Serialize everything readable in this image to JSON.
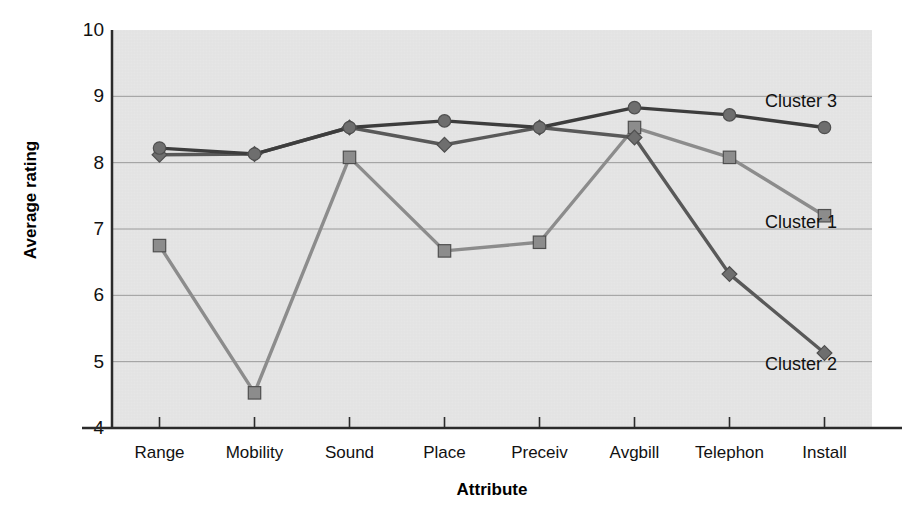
{
  "chart_data": {
    "type": "line",
    "title": "",
    "xlabel": "Attribute",
    "ylabel": "Average rating",
    "categories": [
      "Range",
      "Mobility",
      "Sound",
      "Place",
      "Preceiv",
      "Avgbill",
      "Telephon",
      "Install"
    ],
    "ylim": [
      4,
      10
    ],
    "yticks": [
      4,
      5,
      6,
      7,
      8,
      9,
      10
    ],
    "ytick_labels": [
      "4",
      "5",
      "6",
      "7",
      "8",
      "9",
      "10"
    ],
    "grid": "horizontal",
    "legend_position": "inline-annotations",
    "plot_background": "#e6e6e6",
    "series": [
      {
        "name": "Cluster 1",
        "marker": "square",
        "color": "#8c8c8c",
        "line_color": "#8c8c8c",
        "values": [
          6.75,
          4.53,
          8.08,
          6.67,
          6.8,
          8.53,
          8.08,
          7.2
        ],
        "annotation": "Cluster 1",
        "annotation_x": 765,
        "annotation_y": 213
      },
      {
        "name": "Cluster 2",
        "marker": "diamond",
        "color": "#6e6e6e",
        "line_color": "#595959",
        "values": [
          8.12,
          8.13,
          8.53,
          8.27,
          8.53,
          8.38,
          6.32,
          5.13
        ],
        "annotation": "Cluster 2",
        "annotation_x": 765,
        "annotation_y": 355
      },
      {
        "name": "Cluster 3",
        "marker": "circle",
        "color": "#6e6e6e",
        "line_color": "#3d3d3d",
        "values": [
          8.22,
          8.13,
          8.53,
          8.63,
          8.53,
          8.83,
          8.72,
          8.53
        ],
        "annotation": "Cluster 3",
        "annotation_x": 765,
        "annotation_y": 92
      }
    ]
  },
  "axis": {
    "y_title": "Average rating",
    "x_title": "Attribute"
  }
}
